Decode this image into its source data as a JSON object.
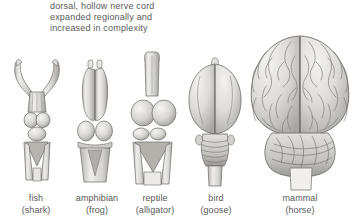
{
  "figure": {
    "name": "vertebrate-brain-evolution-diagram",
    "background_color": "#ffffff",
    "caption": {
      "lines": [
        "dorsal, hollow nerve cord",
        "expanded regionally and",
        "increased in complexity"
      ],
      "text_color": "#5a5a5a"
    },
    "specimens": [
      {
        "id": "fish",
        "common_name": "fish",
        "species_name": "(shark)",
        "label_center_x": 36,
        "description": "elongated narrow brain with forked V-shaped olfactory tracts at anterior end"
      },
      {
        "id": "amphibian",
        "common_name": "amphibian",
        "species_name": "(frog)",
        "label_center_x": 97,
        "description": "paired elongated cerebral lobes with small olfactory bulbs and rounded optic lobes"
      },
      {
        "id": "reptile",
        "common_name": "reptile",
        "species_name": "(alligator)",
        "label_center_x": 155,
        "description": "enlarged rounded cerebral hemispheres with long olfactory tract and triangular medulla"
      },
      {
        "id": "bird",
        "common_name": "bird",
        "species_name": "(goose)",
        "label_center_x": 216,
        "description": "large smooth cerebral hemispheres with transversely ridged cerebellum"
      },
      {
        "id": "mammal",
        "common_name": "mammal",
        "species_name": "(horse)",
        "label_center_x": 300,
        "description": "greatly enlarged deeply convoluted cerebral hemispheres with gyri and sulci, knobby cerebellum"
      }
    ],
    "palette": {
      "tissue_light": "#f2f1ef",
      "tissue_mid": "#d9d7d4",
      "tissue_shadow": "#a8a5a1",
      "tissue_deep": "#8a8784",
      "outline": "#6e6b68",
      "sulcus_line": "#74716e"
    }
  }
}
